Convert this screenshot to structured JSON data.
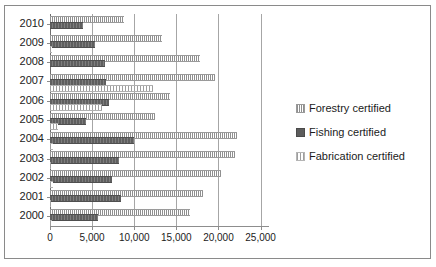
{
  "chart_data": {
    "type": "bar",
    "orientation": "horizontal",
    "title": "",
    "subtitle": "",
    "xlabel": "",
    "ylabel": "",
    "categories": [
      "2010",
      "2009",
      "2008",
      "2007",
      "2006",
      "2005",
      "2004",
      "2003",
      "2002",
      "2001",
      "2000"
    ],
    "series": [
      {
        "name": "Forestry certified",
        "values": [
          8800,
          13300,
          17800,
          19600,
          14200,
          12500,
          22200,
          22000,
          20300,
          18200,
          16600
        ]
      },
      {
        "name": "Fishing certified",
        "values": [
          3900,
          5400,
          6500,
          6700,
          7000,
          4300,
          10000,
          8200,
          7400,
          8400,
          5700
        ]
      },
      {
        "name": "Fabrication certified",
        "values": [
          0,
          200,
          0,
          12200,
          6200,
          1000,
          300,
          150,
          300,
          100,
          250
        ]
      }
    ],
    "xlim": [
      0,
      25000
    ],
    "xticks": [
      0,
      5000,
      10000,
      15000,
      20000,
      25000
    ],
    "xticklabels": [
      "0",
      "5,000",
      "10,000",
      "15,000",
      "20,000",
      "25,000"
    ],
    "grid": "vertical",
    "legend_position": "right",
    "legend": [
      "Forestry certified",
      "Fishing certified",
      "Fabrication certified"
    ],
    "colors": {
      "forestry": "#b9b9b9",
      "fishing": "#6e6e6e",
      "fabrication": "#d2d2d2",
      "gridline": "#a6a6a6",
      "axis": "#8d8d8d",
      "text": "#1b1b1b",
      "background": "#ffffff",
      "frame": "#8a8a8a"
    }
  }
}
